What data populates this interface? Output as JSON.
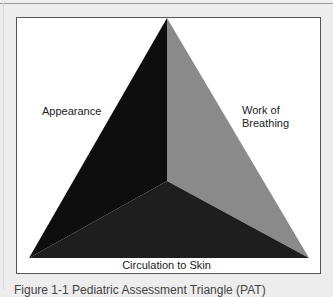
{
  "figure": {
    "type": "Pediatric Assessment Triangle",
    "labels": {
      "left": "Appearance",
      "right_line1": "Work of",
      "right_line2": "Breathing",
      "bottom": "Circulation to Skin"
    },
    "caption": "Figure 1-1 Pediatric Assessment Triangle (PAT)",
    "colors": {
      "background": "#ededed",
      "box": "#ffffff",
      "box_border": "#555555",
      "left_face": "#0e0e0e",
      "right_face": "#8a8a8a",
      "bottom_face": "#1e1e1e"
    }
  }
}
